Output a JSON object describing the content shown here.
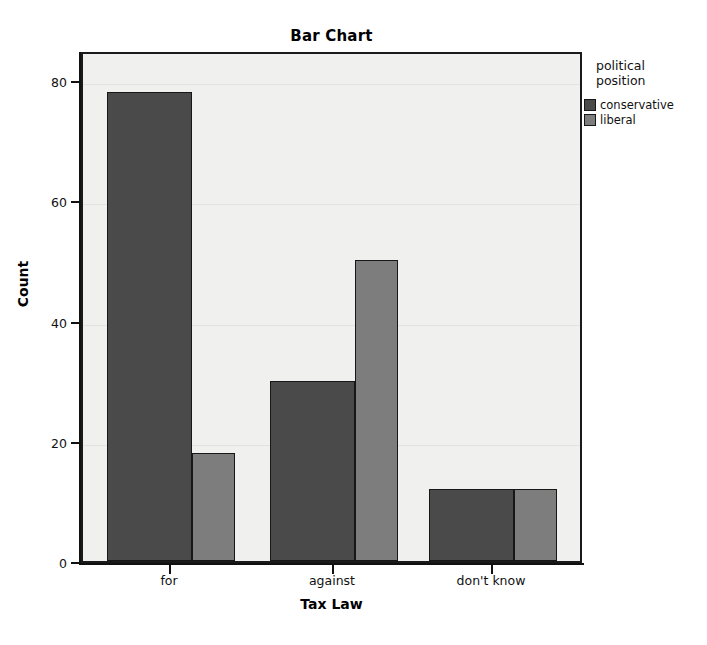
{
  "chart_data": {
    "type": "bar",
    "title": "Bar Chart",
    "xlabel": "Tax Law",
    "ylabel": "Count",
    "categories": [
      "for",
      "against",
      "don't know"
    ],
    "series": [
      {
        "name": "conservative",
        "color": "#4a4a4a",
        "values": [
          78,
          30,
          12
        ]
      },
      {
        "name": "liberal",
        "color": "#7d7d7d",
        "values": [
          18,
          50,
          12
        ]
      }
    ],
    "legend_title": "political position",
    "legend_position": "right",
    "ylim": [
      0,
      85
    ],
    "yticks": [
      0,
      20,
      40,
      60,
      80
    ],
    "ytick_labels": [
      "0",
      "20",
      "40",
      "60",
      "80"
    ],
    "grid": true,
    "plot_background": "#f0f0ee",
    "frame_color": "#1a1a1a"
  },
  "legend": {
    "title_line1": "political",
    "title_line2": "position"
  }
}
